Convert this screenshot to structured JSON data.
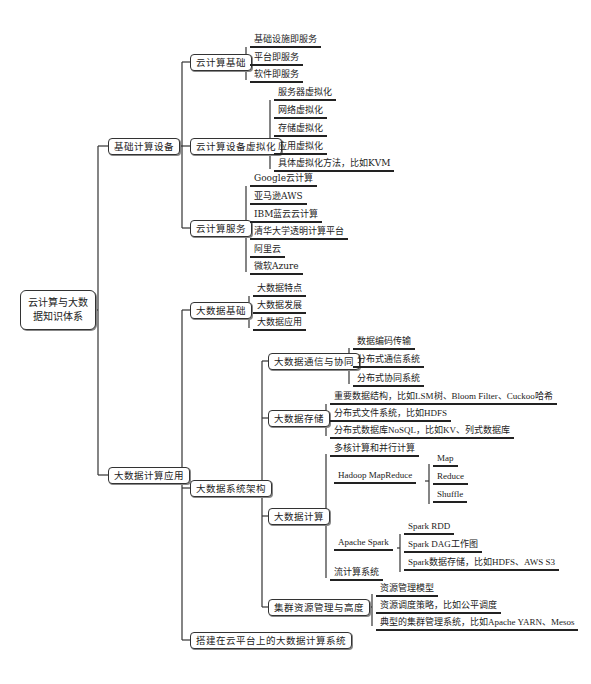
{
  "root": {
    "label": "云计算与大数据知识体系"
  },
  "branches": [
    {
      "label": "基础计算设备",
      "children": [
        {
          "label": "云计算基础",
          "leaves": [
            "基础设施即服务",
            "平台即服务",
            "软件即服务"
          ]
        },
        {
          "label": "云计算设备虚拟化",
          "leaves": [
            "服务器虚拟化",
            "网络虚拟化",
            "存储虚拟化",
            "应用虚拟化",
            "具体虚拟化方法，比如KVM"
          ]
        },
        {
          "label": "云计算服务",
          "leaves": [
            "Google云计算",
            "亚马逊AWS",
            "IBM蓝云云计算",
            "清华大学透明计算平台",
            "阿里云",
            "微软Azure"
          ]
        }
      ]
    },
    {
      "label": "大数据计算应用",
      "children": [
        {
          "label": "大数据基础",
          "leaves": [
            "大数据特点",
            "大数据发展",
            "大数据应用"
          ]
        },
        {
          "label": "大数据系统架构",
          "children": [
            {
              "label": "大数据通信与协同",
              "leaves": [
                "数据编码传输",
                "分布式通信系统",
                "分布式协同系统"
              ]
            },
            {
              "label": "大数据存储",
              "leaves": [
                "重要数据结构，比如LSM树、Bloom Filter、Cuckoo哈希",
                "分布式文件系统，比如HDFS",
                "分布式数据库NoSQL，比如KV、列式数据库"
              ]
            },
            {
              "label": "大数据计算",
              "items": [
                {
                  "label": "多核计算和并行计算"
                },
                {
                  "label": "Hadoop MapReduce",
                  "leaves": [
                    "Map",
                    "Reduce",
                    "Shuffle"
                  ]
                },
                {
                  "label": "Apache Spark",
                  "leaves": [
                    "Spark RDD",
                    "Spark DAG工作图",
                    "Spark数据存储，比如HDFS、AWS S3"
                  ]
                },
                {
                  "label": "流计算系统"
                }
              ]
            },
            {
              "label": "集群资源管理与高度",
              "leaves": [
                "资源管理模型",
                "资源调度策略，比如公平调度",
                "典型的集群管理系统，比如Apache YARN、Mesos"
              ]
            }
          ]
        },
        {
          "label": "搭建在云平台上的大数据计算系统"
        }
      ]
    }
  ]
}
